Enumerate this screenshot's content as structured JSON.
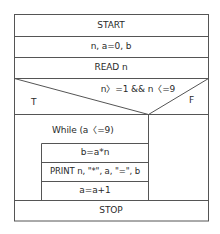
{
  "flowchart": {
    "type": "Nassi-Shneiderman structured chart",
    "start": "START",
    "declare": "n, a=0, b",
    "read": "READ n",
    "decision": {
      "condition": "n〉=1 && n〈=9",
      "true_label": "T",
      "false_label": "F"
    },
    "loop": {
      "header": "While (a〈=9)",
      "body": [
        "b=a*n",
        "PRINT n, \"*\", a, \"=\", b",
        "a=a+1"
      ]
    },
    "stop": "STOP"
  },
  "colors": {
    "line": "#555555",
    "text": "#2a2a2a",
    "background": "#ffffff"
  }
}
